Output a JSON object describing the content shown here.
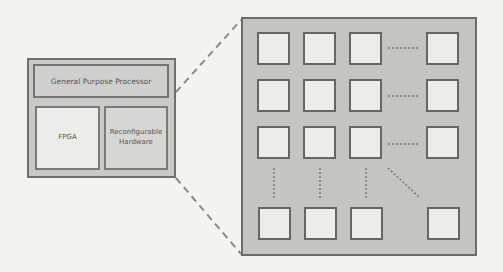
{
  "diagram": {
    "type": "block-diagram-zoom",
    "left_block": {
      "top_label": "General Purpose Processor",
      "bottom_left_label": "FPGA",
      "bottom_right_label": "Reconfigurable Hardware"
    },
    "right_block": {
      "description": "array of processing elements",
      "rows_shown": 4,
      "cols_shown": 4,
      "ellipsis": [
        "horizontal",
        "vertical",
        "diagonal"
      ]
    },
    "connector": "dashed-zoom-lines"
  },
  "colors": {
    "background": "#f3f3f1",
    "panel_fill": "#c4c4c2",
    "cell_fill": "#ececea",
    "stroke": "#6c6c6a"
  }
}
